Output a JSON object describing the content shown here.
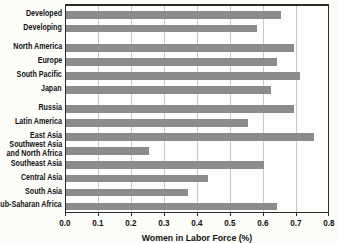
{
  "chart_data": {
    "type": "bar",
    "orientation": "horizontal",
    "title": "",
    "xlabel": "Women in Labor Force (%)",
    "xlim": [
      0,
      0.8
    ],
    "xticks": [
      "0.0",
      "0.1",
      "0.2",
      "0.3",
      "0.4",
      "0.5",
      "0.6",
      "0.7",
      "0.8"
    ],
    "grid": true,
    "legend": false,
    "bar_color": "#8c8c8c",
    "categories": [
      "Developed",
      "Developing",
      "North America",
      "Europe",
      "South Pacific",
      "Japan",
      "Russia",
      "Latin America",
      "East Asia",
      "Southwest Asia and North Africa",
      "Southeast Asia",
      "Central Asia",
      "South Asia",
      "Sub-Saharan Africa"
    ],
    "values": [
      0.65,
      0.58,
      0.69,
      0.64,
      0.71,
      0.62,
      0.69,
      0.55,
      0.75,
      0.25,
      0.6,
      0.43,
      0.37,
      0.64
    ],
    "group_breaks_after": [
      1,
      5
    ]
  }
}
